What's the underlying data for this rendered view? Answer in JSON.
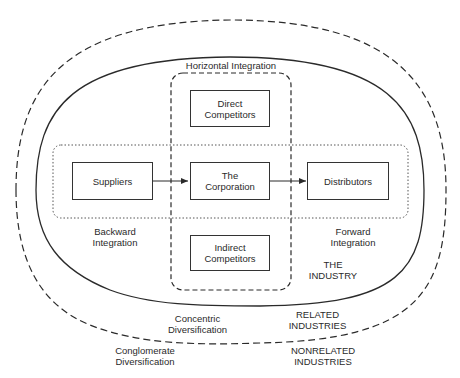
{
  "diagram": {
    "title": "Horizontal Integration",
    "boxes": {
      "direct_competitors": "Direct\nCompetitors",
      "suppliers": "Suppliers",
      "corporation": "The\nCorporation",
      "distributors": "Distributors",
      "indirect_competitors": "Indirect\nCompetitors"
    },
    "labels": {
      "backward_integration": "Backward\nIntegration",
      "forward_integration": "Forward\nIntegration",
      "the_industry": "THE\nINDUSTRY",
      "concentric_diversification": "Concentric\nDiversification",
      "related_industries": "RELATED\nINDUSTRIES",
      "conglomerate_diversification": "Conglomerate\nDiversification",
      "nonrelated_industries": "NONRELATED\nINDUSTRIES"
    },
    "colors": {
      "line": "#2a2a2a",
      "background": "#ffffff"
    }
  }
}
